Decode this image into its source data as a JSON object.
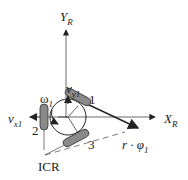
{
  "labels": {
    "y_axis": "Y",
    "y_axis_sub": "R",
    "x_axis": "X",
    "x_axis_sub": "R",
    "vy1": "v",
    "vy1_sub": "y1",
    "vx1": "v",
    "vx1_sub": "x1",
    "omega1": "ω",
    "omega1_sub": "1",
    "wheel1": "1",
    "wheel2": "2",
    "wheel3": "3",
    "r_phi": "r · φ",
    "r_phi_sub": "1",
    "icr": "ICR"
  },
  "colors": {
    "line": "#222222",
    "wheel_fill": "#8a8a8a",
    "wheel_stroke": "#333333"
  }
}
